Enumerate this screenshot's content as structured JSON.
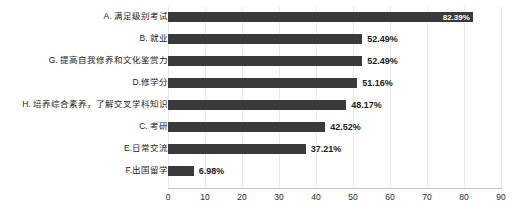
{
  "chart_data": {
    "type": "bar",
    "orientation": "horizontal",
    "title": "",
    "subtitle": "",
    "xlabel": "",
    "ylabel": "",
    "xlim": [
      0,
      90
    ],
    "xticks": [
      0,
      10,
      20,
      30,
      40,
      50,
      60,
      70,
      80,
      90
    ],
    "xtick_labels": [
      "0",
      "10",
      "20",
      "30",
      "40",
      "50",
      "60",
      "70",
      "80",
      "90"
    ],
    "grid": "vertical",
    "legend": "none",
    "bar_color": "#3a3a3a",
    "label_color_inside": "#ffffff",
    "label_color_outside": "#1b1b1b",
    "categories": [
      "A. 满足级别考试",
      "B. 就业",
      "G. 提高自我修养和文化鉴赏力",
      "D.修学分",
      "H. 培养综合素养，了解交叉学科知识",
      "C. 考研",
      "E.日常交流",
      "F.出国留学"
    ],
    "values": [
      82.39,
      52.49,
      52.49,
      51.16,
      48.17,
      42.52,
      37.21,
      6.98
    ],
    "value_labels": [
      "82.39%",
      "52.49%",
      "52.49%",
      "51.16%",
      "48.17%",
      "42.52%",
      "37.21%",
      "6.98%"
    ],
    "label_placement": [
      "inside",
      "outside",
      "outside",
      "outside",
      "outside",
      "outside",
      "outside",
      "outside"
    ]
  }
}
